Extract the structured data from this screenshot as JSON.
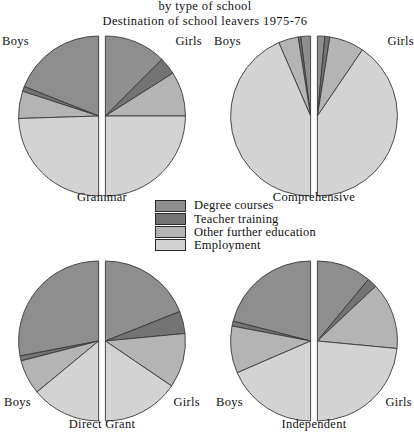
{
  "titles": {
    "line1": "by type of school",
    "line2": "Destination of school leavers 1975-76"
  },
  "labels": {
    "boys": "Boys",
    "girls": "Girls"
  },
  "legend": {
    "items": [
      {
        "label": "Degree courses",
        "color": "#8e8e8e"
      },
      {
        "label": "Teacher training",
        "color": "#737373"
      },
      {
        "label": "Other further education",
        "color": "#b4b4b4"
      },
      {
        "label": "Employment",
        "color": "#d3d3d3"
      }
    ]
  },
  "colors": {
    "degree": "#8e8e8e",
    "teacher": "#737373",
    "other": "#b4b4b4",
    "employment": "#d3d3d3",
    "outline": "#3a3a3a",
    "background": "#ffffff"
  },
  "chart_data": {
    "type": "pie",
    "legend_position": "center",
    "categories": [
      "Degree courses",
      "Teacher training",
      "Other further education",
      "Employment"
    ],
    "charts": [
      {
        "name": "Grammar",
        "position": "top-left",
        "halves": [
          {
            "sex": "Boys",
            "values": [
              38,
              2,
              11,
              49
            ]
          },
          {
            "sex": "Girls",
            "values": [
              25,
              7,
              18,
              50
            ]
          }
        ]
      },
      {
        "name": "Comprehensive",
        "position": "top-right",
        "halves": [
          {
            "sex": "Boys",
            "values": [
              4,
              1,
              8,
              87
            ]
          },
          {
            "sex": "Girls",
            "values": [
              3,
              2,
              14,
              81
            ]
          }
        ]
      },
      {
        "name": "Direct Grant",
        "position": "bottom-left",
        "halves": [
          {
            "sex": "Boys",
            "values": [
              56,
              2,
              14,
              28
            ]
          },
          {
            "sex": "Girls",
            "values": [
              38,
              9,
              22,
              31
            ]
          }
        ]
      },
      {
        "name": "Independent",
        "position": "bottom-right",
        "halves": [
          {
            "sex": "Boys",
            "values": [
              42,
              2,
              19,
              37
            ]
          },
          {
            "sex": "Girls",
            "values": [
              22,
              4,
              27,
              47
            ]
          }
        ]
      }
    ]
  }
}
